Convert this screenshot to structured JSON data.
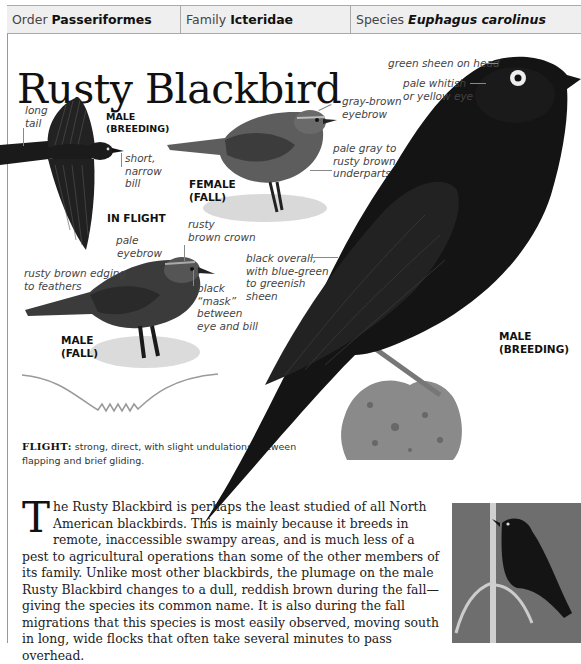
{
  "header": {
    "order_label": "Order",
    "order_value": "Passeriformes",
    "family_label": "Family",
    "family_value": "Icteridae",
    "species_label": "Species",
    "species_value": "Euphagus carolinus"
  },
  "title": "Rusty Blackbird",
  "illustrations": {
    "in_flight": {
      "caption_line1": "MALE",
      "caption_line2": "(BREEDING)",
      "section_label": "IN FLIGHT",
      "annotations": {
        "tail_1": "long",
        "tail_2": "tail",
        "bill_1": "short,",
        "bill_2": "narrow",
        "bill_3": "bill"
      }
    },
    "female_fall": {
      "caption_line1": "FEMALE",
      "caption_line2": "(FALL)",
      "annotations": {
        "eyebrow_1": "gray-brown",
        "eyebrow_2": "eyebrow",
        "underparts_1": "pale gray to",
        "underparts_2": "rusty brown",
        "underparts_3": "underparts"
      }
    },
    "male_fall": {
      "caption_line1": "MALE",
      "caption_line2": "(FALL)",
      "annotations": {
        "crown_1": "rusty",
        "crown_2": "brown crown",
        "eyebrow_1": "pale",
        "eyebrow_2": "eyebrow",
        "edging_1": "rusty brown edging",
        "edging_2": "to feathers",
        "mask_1": "black",
        "mask_2": "“mask”",
        "mask_3": "between",
        "mask_4": "eye and bill"
      }
    },
    "male_breeding": {
      "caption_line1": "MALE",
      "caption_line2": "(BREEDING)",
      "annotations": {
        "head": "green sheen on head",
        "eye_1": "pale whitish",
        "eye_2": "or yellow eye",
        "body_1": "black overall,",
        "body_2": "with blue-green",
        "body_3": "to greenish",
        "body_4": "sheen"
      }
    }
  },
  "flight": {
    "label": "FLIGHT:",
    "text": "strong, direct, with slight undulations between flapping and brief gliding."
  },
  "body_text": {
    "dropcap": "T",
    "text": "he Rusty Blackbird is perhaps the least studied of all North American blackbirds. This is mainly because it breeds in remote, inaccessible swampy areas, and is much less of a pest to agricultural operations than some of the other members of its family. Unlike most other blackbirds, the plumage on the male Rusty Blackbird changes to a dull, reddish brown during the fall—giving the species its common name. It is also during the fall migrations that this species is most easily observed, moving south in long, wide flocks that often take several minutes to pass overhead."
  },
  "colors": {
    "header_bg": "#efefef",
    "border": "#aaaaaa",
    "flight_path": "#9a9a9a",
    "bird_black": "#151515"
  }
}
